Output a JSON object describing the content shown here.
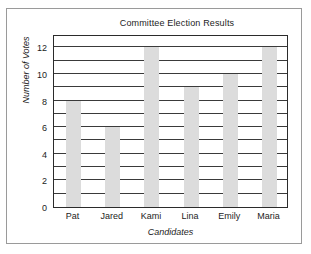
{
  "chart_data": {
    "type": "bar",
    "title": "Committee Election Results",
    "xlabel": "Candidates",
    "ylabel": "Number of Votes",
    "categories": [
      "Pat",
      "Jared",
      "Kami",
      "Lina",
      "Emily",
      "Maria"
    ],
    "values": [
      8,
      6,
      12,
      9,
      10,
      12
    ],
    "ylim": [
      0,
      13
    ],
    "ytick_labels": [
      "0",
      "2",
      "4",
      "6",
      "8",
      "10",
      "12"
    ],
    "ytick_values": [
      0,
      2,
      4,
      6,
      8,
      10,
      12
    ],
    "gridlines": {
      "axis": "y",
      "visible": true,
      "interval": 1,
      "values": [
        1,
        2,
        3,
        4,
        5,
        6,
        7,
        8,
        9,
        10,
        11,
        12,
        13
      ],
      "color": "#3a3a3a"
    },
    "legend": null,
    "bar_color": "#dcdcdc",
    "plot_border_color": "#2b2b2b",
    "figure_border_color": "#9a9a9a"
  }
}
